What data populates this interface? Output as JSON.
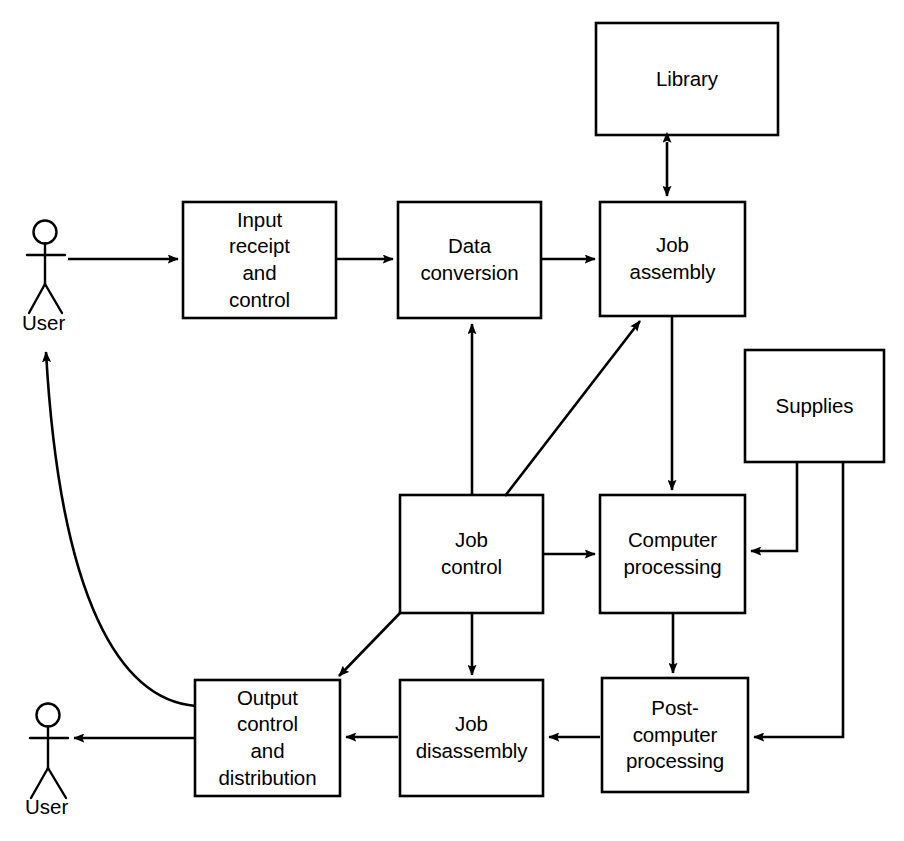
{
  "diagram": {
    "type": "flowchart",
    "background_color": "#ffffff",
    "line_color": "#000000",
    "boxes": [
      {
        "id": "library",
        "label_lines": [
          "Library"
        ],
        "x": 596,
        "y": 23,
        "w": 182,
        "h": 112
      },
      {
        "id": "input_receipt",
        "label_lines": [
          "Input",
          "receipt",
          "and",
          "control"
        ],
        "x": 183,
        "y": 202,
        "w": 153,
        "h": 116
      },
      {
        "id": "data_conversion",
        "label_lines": [
          "Data",
          "conversion"
        ],
        "x": 398,
        "y": 202,
        "w": 143,
        "h": 116
      },
      {
        "id": "job_assembly",
        "label_lines": [
          "Job",
          "assembly"
        ],
        "x": 600,
        "y": 202,
        "w": 145,
        "h": 114
      },
      {
        "id": "supplies",
        "label_lines": [
          "Supplies"
        ],
        "x": 745,
        "y": 350,
        "w": 139,
        "h": 112
      },
      {
        "id": "job_control",
        "label_lines": [
          "Job",
          "control"
        ],
        "x": 400,
        "y": 495,
        "w": 143,
        "h": 118
      },
      {
        "id": "computer_proc",
        "label_lines": [
          "Computer",
          "processing"
        ],
        "x": 600,
        "y": 495,
        "w": 145,
        "h": 118
      },
      {
        "id": "output_control",
        "label_lines": [
          "Output",
          "control",
          "and",
          "distribution"
        ],
        "x": 195,
        "y": 680,
        "w": 145,
        "h": 116
      },
      {
        "id": "job_disassembly",
        "label_lines": [
          "Job",
          "disassembly"
        ],
        "x": 400,
        "y": 680,
        "w": 143,
        "h": 116
      },
      {
        "id": "post_computer",
        "label_lines": [
          "Post-",
          "computer",
          "processing"
        ],
        "x": 602,
        "y": 678,
        "w": 146,
        "h": 114
      }
    ],
    "actors": [
      {
        "id": "user_top",
        "label": "User",
        "head_cx": 45,
        "head_cy": 232,
        "label_x": 22,
        "label_y": 312
      },
      {
        "id": "user_bottom",
        "label": "User",
        "head_cx": 48,
        "head_cy": 715,
        "label_x": 25,
        "label_y": 796
      }
    ],
    "connectors": [
      {
        "id": "user-to-input",
        "from": "user_top",
        "to": "input_receipt",
        "kind": "arrow"
      },
      {
        "id": "input-to-data",
        "from": "input_receipt",
        "to": "data_conversion",
        "kind": "arrow"
      },
      {
        "id": "data-to-assembly",
        "from": "data_conversion",
        "to": "job_assembly",
        "kind": "arrow"
      },
      {
        "id": "library-assembly",
        "from": "library",
        "to": "job_assembly",
        "kind": "double-arrow"
      },
      {
        "id": "assembly-to-computer",
        "from": "job_assembly",
        "to": "computer_proc",
        "kind": "arrow"
      },
      {
        "id": "control-to-data",
        "from": "job_control",
        "to": "data_conversion",
        "kind": "arrow"
      },
      {
        "id": "control-to-assembly",
        "from": "job_control",
        "to": "job_assembly",
        "kind": "arrow"
      },
      {
        "id": "control-to-computer",
        "from": "job_control",
        "to": "computer_proc",
        "kind": "arrow"
      },
      {
        "id": "control-to-output",
        "from": "job_control",
        "to": "output_control",
        "kind": "arrow"
      },
      {
        "id": "control-to-disassembly",
        "from": "job_control",
        "to": "job_disassembly",
        "kind": "arrow"
      },
      {
        "id": "supplies-to-computer",
        "from": "supplies",
        "to": "computer_proc",
        "kind": "arrow"
      },
      {
        "id": "supplies-to-post",
        "from": "supplies",
        "to": "post_computer",
        "kind": "arrow"
      },
      {
        "id": "computer-to-post",
        "from": "computer_proc",
        "to": "post_computer",
        "kind": "arrow"
      },
      {
        "id": "post-to-disassembly",
        "from": "post_computer",
        "to": "job_disassembly",
        "kind": "arrow"
      },
      {
        "id": "disassembly-to-output",
        "from": "job_disassembly",
        "to": "output_control",
        "kind": "arrow"
      },
      {
        "id": "output-to-user-bottom",
        "from": "output_control",
        "to": "user_bottom",
        "kind": "arrow"
      },
      {
        "id": "output-to-user-top",
        "from": "output_control",
        "to": "user_top",
        "kind": "curved-arrow"
      }
    ]
  }
}
